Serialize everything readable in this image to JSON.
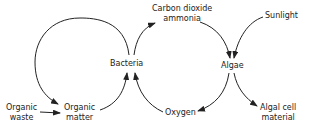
{
  "diagram": {
    "type": "cycle-flow",
    "nodes": {
      "organic_waste": "Organic waste",
      "organic_waste_l1": "Organic",
      "organic_waste_l2": "waste",
      "organic_matter_l1": "Organic",
      "organic_matter_l2": "matter",
      "bacteria": "Bacteria",
      "co2_l1": "Carbon dioxide",
      "co2_l2": "ammonia",
      "sunlight": "Sunlight",
      "algae": "Algae",
      "oxygen": "Oxygen",
      "algal_l1": "Algal cell",
      "algal_l2": "material"
    },
    "edges": [
      {
        "from": "Organic waste",
        "to": "Organic matter"
      },
      {
        "from": "Organic matter",
        "to": "Bacteria"
      },
      {
        "from": "Bacteria",
        "to": "Organic matter"
      },
      {
        "from": "Bacteria",
        "to": "Carbon dioxide ammonia"
      },
      {
        "from": "Carbon dioxide ammonia",
        "to": "Algae"
      },
      {
        "from": "Sunlight",
        "to": "Algae"
      },
      {
        "from": "Algae",
        "to": "Oxygen"
      },
      {
        "from": "Oxygen",
        "to": "Bacteria"
      },
      {
        "from": "Algae",
        "to": "Algal cell material"
      }
    ],
    "line_color": "#222222"
  }
}
